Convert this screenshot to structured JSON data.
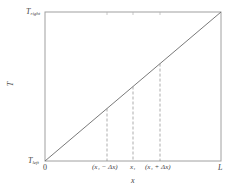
{
  "diagram": {
    "type": "line",
    "title": "",
    "xlabel": "x",
    "ylabel": "T",
    "frame": {
      "x0": 45,
      "y0": 12,
      "x1": 221,
      "y1": 161
    },
    "colors": {
      "frame": "#9a9a9a",
      "line": "#666666",
      "dashed": "#8a8a8a",
      "text": "#444444"
    },
    "y_ticks": [
      {
        "label_main": "T",
        "label_sub": "right",
        "position": "top"
      },
      {
        "label_main": "T",
        "label_sub": "left",
        "position": "bottom"
      }
    ],
    "x_ticks": [
      {
        "label": "0",
        "x": 45
      },
      {
        "label": "(x₁ − Δx)",
        "x": 107
      },
      {
        "label": "x₁",
        "x": 133
      },
      {
        "label": "(x₁ + Δx)",
        "x": 160
      },
      {
        "label": "L",
        "x": 221
      }
    ],
    "series": [
      {
        "name": "temperature-profile",
        "points": [
          [
            0,
            "T_left"
          ],
          [
            "L",
            "T_right"
          ]
        ],
        "style": "solid"
      }
    ],
    "dashed_guides": [
      {
        "x_label": "(x₁ − Δx)",
        "x": 107
      },
      {
        "x_label": "x₁",
        "x": 133
      },
      {
        "x_label": "(x₁ + Δx)",
        "x": 160
      }
    ]
  },
  "labels": {
    "t_right_main": "T",
    "t_right_sub": "right",
    "t_left_main": "T",
    "t_left_sub": "left",
    "y_axis": "T",
    "x_axis": "x",
    "zero": "0",
    "x1_minus": "(x₁ − Δx)",
    "x1": "x₁",
    "x1_plus": "(x₁ + Δx)",
    "L": "L"
  }
}
